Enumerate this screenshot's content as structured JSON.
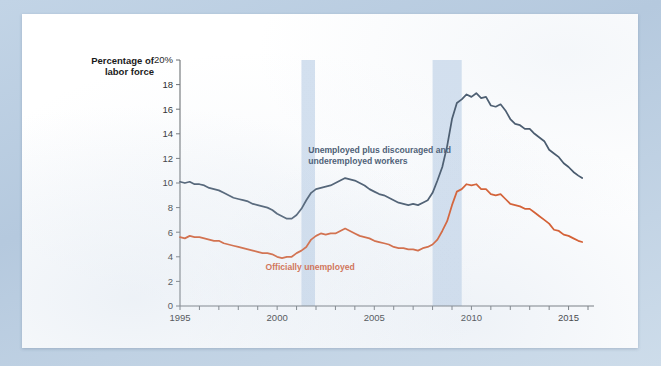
{
  "chart_data": {
    "type": "line",
    "title": "",
    "ylabel": "Percentage of labor force",
    "xlabel": "",
    "xlim": [
      1995,
      2016
    ],
    "ylim": [
      0,
      20
    ],
    "grid": false,
    "legend_position": "inline-annotation",
    "y_ticks": [
      "0",
      "2",
      "4",
      "6",
      "8",
      "10",
      "12",
      "14",
      "16",
      "18",
      "20%"
    ],
    "y_tick_values": [
      0,
      2,
      4,
      6,
      8,
      10,
      12,
      14,
      16,
      18,
      20
    ],
    "x_ticks": [
      "1995",
      "2000",
      "2005",
      "2010",
      "2015"
    ],
    "x_tick_values": [
      1995,
      2000,
      2005,
      2010,
      2015
    ],
    "x_minor_tick_values": [
      1996,
      1997,
      1998,
      1999,
      2001,
      2002,
      2003,
      2004,
      2006,
      2007,
      2008,
      2009,
      2011,
      2012,
      2013,
      2014,
      2016
    ],
    "annotations": [
      {
        "name": "blue-series-label",
        "text_line1": "Unemployed plus discouraged and",
        "text_line2": "underemployed workers",
        "color": "#3c5068",
        "x": 2001.6,
        "y": 12.4
      },
      {
        "name": "red-series-label",
        "text": "Officially unemployed",
        "color": "#d4511f",
        "x": 1999.4,
        "y": 2.9
      }
    ],
    "shaded_regions": [
      {
        "name": "recession-2001",
        "x0": 2001.25,
        "x1": 2001.95,
        "color": "#d3e0ef"
      },
      {
        "name": "recession-2008",
        "x0": 2008.0,
        "x1": 2009.5,
        "color": "#d3e0ef"
      }
    ],
    "series": [
      {
        "name": "Unemployed plus discouraged and underemployed workers",
        "color": "#3a4c60",
        "x": [
          1995.0,
          1995.25,
          1995.5,
          1995.75,
          1996.0,
          1996.25,
          1996.5,
          1996.75,
          1997.0,
          1997.25,
          1997.5,
          1997.75,
          1998.0,
          1998.25,
          1998.5,
          1998.75,
          1999.0,
          1999.25,
          1999.5,
          1999.75,
          2000.0,
          2000.25,
          2000.5,
          2000.75,
          2001.0,
          2001.25,
          2001.5,
          2001.75,
          2002.0,
          2002.25,
          2002.5,
          2002.75,
          2003.0,
          2003.25,
          2003.5,
          2003.75,
          2004.0,
          2004.25,
          2004.5,
          2004.75,
          2005.0,
          2005.25,
          2005.5,
          2005.75,
          2006.0,
          2006.25,
          2006.5,
          2006.75,
          2007.0,
          2007.25,
          2007.5,
          2007.75,
          2008.0,
          2008.25,
          2008.5,
          2008.75,
          2009.0,
          2009.25,
          2009.5,
          2009.75,
          2010.0,
          2010.25,
          2010.5,
          2010.75,
          2011.0,
          2011.25,
          2011.5,
          2011.75,
          2012.0,
          2012.25,
          2012.5,
          2012.75,
          2013.0,
          2013.25,
          2013.5,
          2013.75,
          2014.0,
          2014.25,
          2014.5,
          2014.75,
          2015.0,
          2015.25,
          2015.5,
          2015.7
        ],
        "y": [
          10.1,
          10.0,
          10.1,
          9.9,
          9.9,
          9.8,
          9.6,
          9.5,
          9.4,
          9.2,
          9.0,
          8.8,
          8.7,
          8.6,
          8.5,
          8.3,
          8.2,
          8.1,
          8.0,
          7.8,
          7.5,
          7.3,
          7.1,
          7.1,
          7.4,
          7.9,
          8.6,
          9.2,
          9.5,
          9.6,
          9.7,
          9.8,
          10.0,
          10.2,
          10.4,
          10.3,
          10.2,
          10.0,
          9.8,
          9.5,
          9.3,
          9.1,
          9.0,
          8.8,
          8.6,
          8.4,
          8.3,
          8.2,
          8.3,
          8.2,
          8.4,
          8.6,
          9.2,
          10.2,
          11.3,
          13.0,
          15.2,
          16.5,
          16.8,
          17.2,
          17.0,
          17.3,
          16.9,
          17.0,
          16.3,
          16.2,
          16.4,
          15.9,
          15.2,
          14.8,
          14.7,
          14.4,
          14.4,
          14.0,
          13.7,
          13.4,
          12.7,
          12.4,
          12.1,
          11.6,
          11.3,
          10.9,
          10.6,
          10.4
        ]
      },
      {
        "name": "Officially unemployed",
        "color": "#d6501d",
        "x": [
          1995.0,
          1995.25,
          1995.5,
          1995.75,
          1996.0,
          1996.25,
          1996.5,
          1996.75,
          1997.0,
          1997.25,
          1997.5,
          1997.75,
          1998.0,
          1998.25,
          1998.5,
          1998.75,
          1999.0,
          1999.25,
          1999.5,
          1999.75,
          2000.0,
          2000.25,
          2000.5,
          2000.75,
          2001.0,
          2001.25,
          2001.5,
          2001.75,
          2002.0,
          2002.25,
          2002.5,
          2002.75,
          2003.0,
          2003.25,
          2003.5,
          2003.75,
          2004.0,
          2004.25,
          2004.5,
          2004.75,
          2005.0,
          2005.25,
          2005.5,
          2005.75,
          2006.0,
          2006.25,
          2006.5,
          2006.75,
          2007.0,
          2007.25,
          2007.5,
          2007.75,
          2008.0,
          2008.25,
          2008.5,
          2008.75,
          2009.0,
          2009.25,
          2009.5,
          2009.75,
          2010.0,
          2010.25,
          2010.5,
          2010.75,
          2011.0,
          2011.25,
          2011.5,
          2011.75,
          2012.0,
          2012.25,
          2012.5,
          2012.75,
          2013.0,
          2013.25,
          2013.5,
          2013.75,
          2014.0,
          2014.25,
          2014.5,
          2014.75,
          2015.0,
          2015.25,
          2015.5,
          2015.7
        ],
        "y": [
          5.6,
          5.5,
          5.7,
          5.6,
          5.6,
          5.5,
          5.4,
          5.3,
          5.3,
          5.1,
          5.0,
          4.9,
          4.8,
          4.7,
          4.6,
          4.5,
          4.4,
          4.3,
          4.3,
          4.2,
          4.0,
          3.9,
          4.0,
          4.0,
          4.3,
          4.5,
          4.8,
          5.4,
          5.7,
          5.9,
          5.8,
          5.9,
          5.9,
          6.1,
          6.3,
          6.1,
          5.9,
          5.7,
          5.6,
          5.5,
          5.3,
          5.2,
          5.1,
          5.0,
          4.8,
          4.7,
          4.7,
          4.6,
          4.6,
          4.5,
          4.7,
          4.8,
          5.0,
          5.4,
          6.1,
          6.9,
          8.2,
          9.3,
          9.5,
          9.9,
          9.8,
          9.9,
          9.5,
          9.5,
          9.1,
          9.0,
          9.1,
          8.7,
          8.3,
          8.2,
          8.1,
          7.9,
          7.9,
          7.6,
          7.3,
          7.0,
          6.7,
          6.2,
          6.1,
          5.8,
          5.7,
          5.5,
          5.3,
          5.2
        ]
      }
    ]
  }
}
